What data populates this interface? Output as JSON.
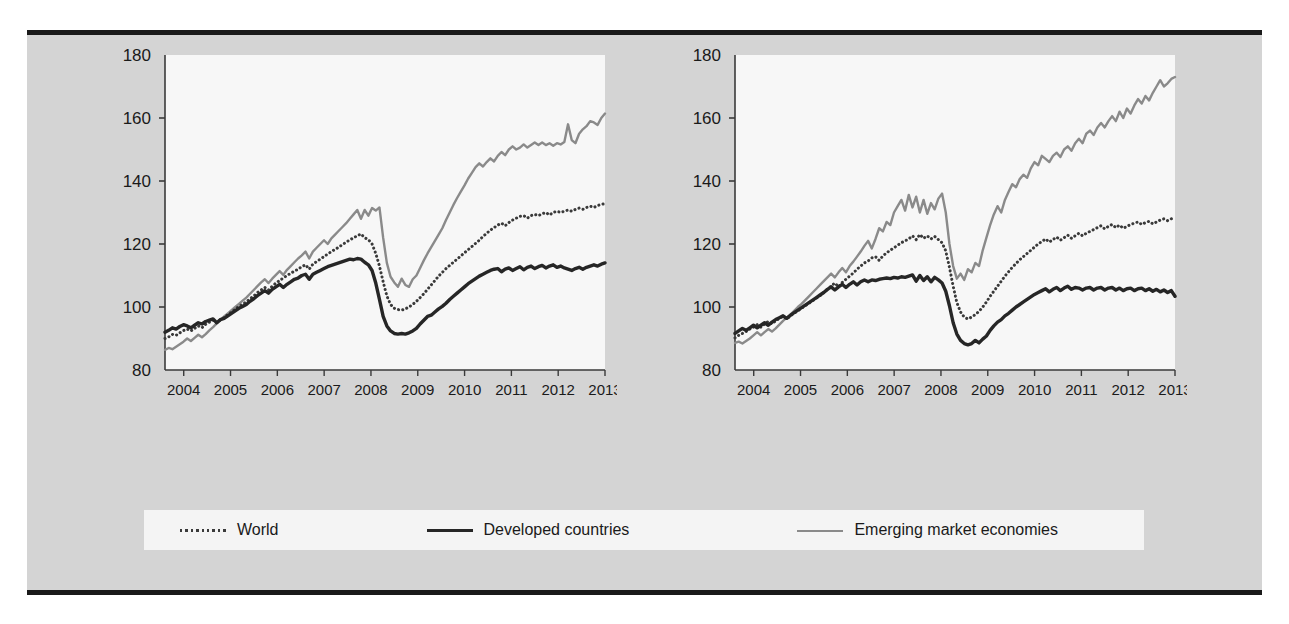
{
  "figure": {
    "background_color": "#d4d4d4",
    "plot_background_color": "#f7f7f7",
    "border_color": "#1a1a1a"
  },
  "series_styles": {
    "world": {
      "color": "#3a3a3a",
      "style": "dotted",
      "width": 2.6
    },
    "developed": {
      "color": "#262626",
      "style": "solid",
      "width": 3.4
    },
    "emerging": {
      "color": "#8a8a8a",
      "style": "solid",
      "width": 2.4
    }
  },
  "legend": {
    "items": [
      {
        "key": "world",
        "label": "World",
        "style": "dotted",
        "color": "#3a3a3a"
      },
      {
        "key": "developed",
        "label": "Developed countries",
        "style": "solid",
        "color": "#262626"
      },
      {
        "key": "emerging",
        "label": "Emerging market economies",
        "style": "solid",
        "color": "#8a8a8a"
      }
    ]
  },
  "chart_data": [
    {
      "type": "line",
      "title": "Volume of exports",
      "xlabel": "",
      "ylabel": "",
      "ylim": [
        80,
        180
      ],
      "yticks": [
        80,
        100,
        120,
        140,
        160,
        180
      ],
      "ytick_labels": [
        "80",
        "100",
        "120",
        "140",
        "160",
        "180"
      ],
      "xlim": [
        2003.6,
        2013.0
      ],
      "xticks": [
        2004,
        2005,
        2006,
        2007,
        2008,
        2009,
        2010,
        2011,
        2012,
        2013
      ],
      "xtick_labels": [
        "2004",
        "2005",
        "2006",
        "2007",
        "2008",
        "2009",
        "2010",
        "2011",
        "2012",
        "2013"
      ],
      "grid": false,
      "legend_position": "below-figure",
      "x_step_months": 1,
      "x_start": 2003.6,
      "series": [
        {
          "name": "World",
          "key": "world",
          "values": [
            90.0,
            90.5,
            91.3,
            91.0,
            91.8,
            92.5,
            93.0,
            92.4,
            93.2,
            94.0,
            93.4,
            94.5,
            95.2,
            95.8,
            95.0,
            96.0,
            96.6,
            97.6,
            98.4,
            99.3,
            100.2,
            100.9,
            101.6,
            102.6,
            103.5,
            104.6,
            105.4,
            106.2,
            105.4,
            106.6,
            107.6,
            108.4,
            109.2,
            110.0,
            110.7,
            111.4,
            112.0,
            112.8,
            113.4,
            112.0,
            113.6,
            114.4,
            115.2,
            116.0,
            116.8,
            117.6,
            118.3,
            119.0,
            119.8,
            120.6,
            121.3,
            122.0,
            122.6,
            123.2,
            122.0,
            121.4,
            120.0,
            117.0,
            113.0,
            108.0,
            103.5,
            100.8,
            99.6,
            99.2,
            99.0,
            99.4,
            100.0,
            100.8,
            101.8,
            103.0,
            104.2,
            105.6,
            107.0,
            108.4,
            109.8,
            111.0,
            112.2,
            113.2,
            114.2,
            115.2,
            116.2,
            117.2,
            118.2,
            119.2,
            120.2,
            121.2,
            122.4,
            123.4,
            124.4,
            125.2,
            126.0,
            126.6,
            125.8,
            126.8,
            127.6,
            128.2,
            128.8,
            129.0,
            128.2,
            129.0,
            129.4,
            129.0,
            129.6,
            130.0,
            129.2,
            130.0,
            130.4,
            130.0,
            130.4,
            130.8,
            130.4,
            131.0,
            131.4,
            131.0,
            131.6,
            132.0,
            131.6,
            132.2,
            132.6,
            132.8
          ]
        },
        {
          "name": "Developed countries",
          "key": "developed",
          "values": [
            92.0,
            92.6,
            93.4,
            93.0,
            93.8,
            94.4,
            94.0,
            93.4,
            94.2,
            95.0,
            94.6,
            95.4,
            95.8,
            96.2,
            95.0,
            96.0,
            96.4,
            97.2,
            98.0,
            98.8,
            99.6,
            100.2,
            100.8,
            101.8,
            102.6,
            103.6,
            104.4,
            105.2,
            104.4,
            105.6,
            106.4,
            107.2,
            106.2,
            107.2,
            108.0,
            108.8,
            109.2,
            110.0,
            110.4,
            108.8,
            110.4,
            111.0,
            111.6,
            112.2,
            112.8,
            113.2,
            113.6,
            114.0,
            114.4,
            114.8,
            115.2,
            115.0,
            115.4,
            115.2,
            114.2,
            113.4,
            111.6,
            107.6,
            102.4,
            97.0,
            94.0,
            92.4,
            91.6,
            91.4,
            91.6,
            91.4,
            91.8,
            92.4,
            93.2,
            94.6,
            95.8,
            97.0,
            97.4,
            98.4,
            99.4,
            100.2,
            101.2,
            102.4,
            103.4,
            104.4,
            105.4,
            106.4,
            107.4,
            108.2,
            109.0,
            109.8,
            110.4,
            111.0,
            111.6,
            112.0,
            112.2,
            111.2,
            112.0,
            112.4,
            111.6,
            112.2,
            112.8,
            111.8,
            112.6,
            113.0,
            112.2,
            112.8,
            113.2,
            112.4,
            113.0,
            113.4,
            112.6,
            113.0,
            112.4,
            112.0,
            111.6,
            112.2,
            112.6,
            112.0,
            112.6,
            113.0,
            113.4,
            113.0,
            113.6,
            114.0
          ]
        },
        {
          "name": "Emerging market economies",
          "key": "emerging",
          "values": [
            86.4,
            87.0,
            86.6,
            87.4,
            88.2,
            89.0,
            90.0,
            89.2,
            90.2,
            91.2,
            90.4,
            91.4,
            92.6,
            93.6,
            94.8,
            96.0,
            97.0,
            98.0,
            99.0,
            100.0,
            101.0,
            102.0,
            103.0,
            104.2,
            105.4,
            106.6,
            107.8,
            108.8,
            107.6,
            109.0,
            110.2,
            111.4,
            110.2,
            111.8,
            113.0,
            114.2,
            115.4,
            116.4,
            117.6,
            115.4,
            117.6,
            118.8,
            120.0,
            121.2,
            120.0,
            121.8,
            123.0,
            124.2,
            125.4,
            126.6,
            128.0,
            129.4,
            130.8,
            128.0,
            130.8,
            129.0,
            131.4,
            130.6,
            131.6,
            122.0,
            114.0,
            109.6,
            107.8,
            106.4,
            109.0,
            107.0,
            106.4,
            108.8,
            110.0,
            112.4,
            114.8,
            117.0,
            119.0,
            121.0,
            123.0,
            125.0,
            127.6,
            130.0,
            132.4,
            134.6,
            136.6,
            138.6,
            140.8,
            142.6,
            144.4,
            145.6,
            144.6,
            146.0,
            147.2,
            146.2,
            148.0,
            149.2,
            148.2,
            150.0,
            151.0,
            150.0,
            150.6,
            151.6,
            150.6,
            151.4,
            152.2,
            151.4,
            152.2,
            151.4,
            152.0,
            151.2,
            152.0,
            151.6,
            152.4,
            158.0,
            153.0,
            152.0,
            155.0,
            156.4,
            157.4,
            159.0,
            158.6,
            157.8,
            160.0,
            161.4
          ]
        }
      ]
    },
    {
      "type": "line",
      "title": "Volume of imports",
      "xlabel": "",
      "ylabel": "",
      "ylim": [
        80,
        180
      ],
      "yticks": [
        80,
        100,
        120,
        140,
        160,
        180
      ],
      "ytick_labels": [
        "80",
        "100",
        "120",
        "140",
        "160",
        "180"
      ],
      "xlim": [
        2003.6,
        2013.0
      ],
      "xticks": [
        2004,
        2005,
        2006,
        2007,
        2008,
        2009,
        2010,
        2011,
        2012,
        2013
      ],
      "xtick_labels": [
        "2004",
        "2005",
        "2006",
        "2007",
        "2008",
        "2009",
        "2010",
        "2011",
        "2012",
        "2013"
      ],
      "grid": false,
      "legend_position": "below-figure",
      "x_step_months": 1,
      "x_start": 2003.6,
      "series": [
        {
          "name": "World",
          "key": "world",
          "values": [
            90.2,
            91.0,
            91.6,
            92.2,
            93.0,
            93.6,
            94.4,
            93.6,
            94.6,
            95.4,
            94.6,
            95.6,
            96.4,
            97.0,
            96.2,
            97.2,
            98.0,
            98.8,
            99.6,
            100.4,
            101.2,
            102.0,
            102.8,
            103.6,
            104.6,
            105.6,
            106.6,
            107.6,
            106.4,
            107.8,
            108.8,
            109.8,
            110.8,
            112.0,
            113.0,
            114.0,
            114.6,
            115.6,
            116.0,
            114.8,
            116.2,
            117.2,
            118.0,
            118.8,
            119.6,
            120.4,
            121.0,
            121.6,
            122.6,
            121.4,
            123.0,
            121.8,
            122.6,
            121.6,
            122.4,
            121.4,
            120.4,
            117.8,
            112.6,
            106.6,
            101.4,
            98.4,
            96.8,
            96.2,
            96.8,
            97.6,
            98.6,
            100.0,
            101.6,
            103.4,
            105.0,
            106.6,
            108.2,
            109.8,
            111.2,
            112.6,
            113.8,
            115.0,
            116.0,
            117.0,
            118.0,
            119.0,
            120.0,
            120.8,
            121.6,
            120.6,
            121.4,
            122.2,
            121.2,
            122.0,
            122.8,
            121.8,
            122.6,
            123.4,
            122.6,
            123.4,
            124.0,
            124.6,
            125.2,
            125.8,
            124.8,
            125.6,
            126.2,
            125.2,
            126.0,
            125.0,
            125.6,
            126.2,
            126.6,
            127.0,
            126.2,
            126.8,
            127.2,
            126.4,
            127.0,
            127.6,
            128.0,
            127.4,
            128.0,
            128.4
          ]
        },
        {
          "name": "Developed countries",
          "key": "developed",
          "values": [
            91.6,
            92.4,
            93.2,
            92.6,
            93.4,
            94.2,
            93.4,
            94.2,
            95.0,
            94.2,
            95.2,
            96.0,
            96.6,
            97.2,
            96.4,
            97.4,
            98.2,
            99.0,
            99.8,
            100.6,
            101.4,
            102.2,
            103.0,
            103.8,
            104.6,
            105.6,
            106.4,
            105.4,
            106.4,
            107.2,
            106.2,
            107.2,
            108.0,
            107.0,
            108.0,
            108.6,
            108.0,
            108.6,
            108.4,
            108.8,
            109.0,
            109.2,
            109.0,
            109.4,
            109.2,
            109.6,
            109.4,
            109.8,
            110.2,
            108.2,
            110.0,
            108.4,
            109.6,
            108.0,
            109.4,
            108.6,
            107.6,
            105.0,
            100.4,
            95.0,
            91.4,
            89.4,
            88.4,
            88.0,
            88.4,
            89.4,
            88.6,
            89.8,
            90.8,
            92.6,
            94.0,
            95.2,
            96.0,
            97.2,
            98.0,
            99.0,
            100.0,
            100.8,
            101.6,
            102.4,
            103.2,
            104.0,
            104.6,
            105.2,
            105.8,
            104.8,
            105.6,
            106.2,
            105.2,
            106.0,
            106.6,
            105.6,
            106.2,
            106.0,
            105.4,
            106.0,
            106.2,
            105.4,
            106.0,
            106.2,
            105.4,
            106.0,
            106.2,
            105.4,
            106.0,
            105.2,
            105.8,
            106.0,
            105.2,
            105.8,
            106.0,
            105.2,
            105.8,
            105.0,
            105.6,
            104.8,
            105.4,
            104.6,
            105.2,
            103.4
          ]
        },
        {
          "name": "Emerging market economies",
          "key": "emerging",
          "values": [
            88.6,
            89.0,
            88.4,
            89.2,
            90.0,
            91.0,
            92.0,
            91.0,
            92.0,
            93.0,
            92.2,
            93.2,
            94.4,
            95.6,
            96.6,
            97.6,
            98.8,
            100.0,
            101.0,
            102.2,
            103.4,
            104.6,
            105.8,
            107.0,
            108.2,
            109.4,
            110.6,
            109.4,
            111.0,
            112.4,
            111.0,
            113.0,
            114.4,
            116.0,
            117.6,
            119.4,
            121.0,
            118.6,
            121.6,
            125.0,
            124.0,
            127.0,
            126.0,
            130.0,
            132.0,
            134.0,
            130.6,
            135.6,
            131.6,
            135.0,
            130.0,
            134.0,
            129.6,
            133.0,
            131.0,
            134.4,
            136.0,
            130.0,
            120.0,
            113.0,
            109.0,
            110.6,
            108.6,
            112.0,
            111.0,
            114.0,
            113.0,
            118.0,
            122.0,
            126.0,
            129.4,
            132.0,
            130.0,
            134.0,
            136.6,
            139.0,
            138.0,
            140.6,
            142.0,
            141.0,
            144.0,
            146.0,
            145.0,
            148.0,
            147.0,
            146.0,
            148.0,
            149.0,
            147.6,
            150.0,
            151.0,
            149.6,
            152.0,
            153.4,
            152.0,
            155.0,
            156.0,
            154.6,
            157.0,
            158.4,
            157.0,
            159.0,
            160.6,
            159.0,
            162.0,
            160.0,
            163.0,
            161.4,
            164.0,
            166.0,
            164.6,
            167.0,
            165.6,
            168.0,
            170.0,
            172.0,
            170.0,
            171.0,
            172.4,
            173.0
          ]
        }
      ]
    }
  ]
}
